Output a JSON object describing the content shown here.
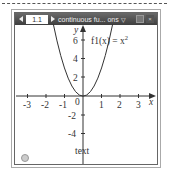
{
  "window": {
    "page_number": "1.1",
    "doc_title": "continuous fu... ons",
    "dropdown_icon": "chevron-down-icon",
    "prev_icon": "triangle-left-icon",
    "next_icon": "triangle-right-icon",
    "buttons": [
      "restore-icon",
      "close-icon"
    ]
  },
  "graph": {
    "function_label": "f1(x) = x",
    "function_exponent": "2",
    "x_axis_label": "x",
    "y_axis_label": "y",
    "x_ticks": [
      "-3",
      "-2",
      "-1",
      "0",
      "1",
      "2",
      "3"
    ],
    "y_ticks": [
      "6",
      "4",
      "2",
      "-2",
      "-4"
    ],
    "text_label": "text",
    "curve_color": "#333333"
  }
}
